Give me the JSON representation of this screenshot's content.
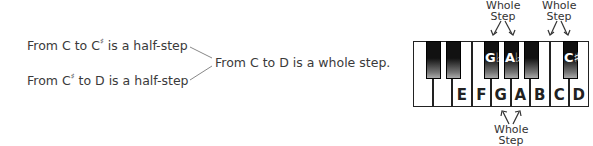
{
  "left_text": {
    "line1_prefix": "From C to C",
    "line1_sup": "♯",
    "line1_suffix": " is a half-step",
    "line2_prefix": "From C",
    "line2_sup": "♯",
    "line2_suffix": " to D is a half-step",
    "conclusion": "From C to D is a whole step."
  },
  "piano": {
    "white_keys": [
      {
        "label": ""
      },
      {
        "label": ""
      },
      {
        "label": "E"
      },
      {
        "label": "F"
      },
      {
        "label": "G"
      },
      {
        "label": "A"
      },
      {
        "label": "B"
      },
      {
        "label": "C"
      },
      {
        "label": "D"
      }
    ],
    "black_keys": [
      {
        "label": "",
        "x": 13
      },
      {
        "label": "",
        "x": 33
      },
      {
        "label": "G♭",
        "x": 71
      },
      {
        "label": "A♭",
        "x": 91
      },
      {
        "label": "",
        "x": 111
      },
      {
        "label": "C♯",
        "x": 150
      }
    ]
  },
  "annotations": {
    "top_left": {
      "line1": "Whole",
      "line2": "Step"
    },
    "top_right": {
      "line1": "Whole",
      "line2": "Step"
    },
    "bottom": {
      "line1": "Whole",
      "line2": "Step"
    }
  }
}
